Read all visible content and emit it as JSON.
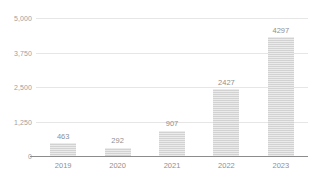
{
  "chart_data": {
    "type": "bar",
    "title": "",
    "subtitle": "",
    "xlabel": "",
    "ylabel": "",
    "categories": [
      "2019",
      "2020",
      "2021",
      "2022",
      "2023"
    ],
    "values": [
      463,
      292,
      907,
      2427,
      4297
    ],
    "value_labels": [
      "463",
      "292",
      "907",
      "2427",
      "4297"
    ],
    "ylim": [
      0,
      5000
    ],
    "yticks": [
      0,
      1250,
      2500,
      3750,
      5000
    ],
    "ytick_labels": [
      "0",
      "1,250",
      "2,500",
      "3,750",
      "5,000"
    ],
    "grid": true,
    "grid_axis": "y",
    "legend": false,
    "legend_position": "none",
    "bar_color": "#d2d2d2",
    "gridline_color": "#e6e6e6",
    "axis_line_color": "#8c8c8c",
    "label_color": "#8f8f8f",
    "tick_color": "#a0a0a0",
    "background_color": "#ffffff"
  }
}
